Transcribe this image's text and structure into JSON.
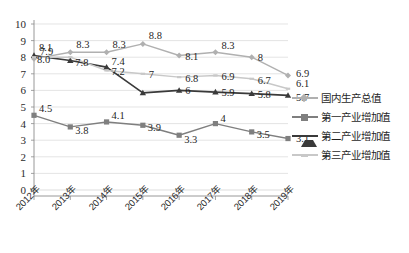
{
  "chart_data": {
    "type": "line",
    "title": "",
    "xlabel": "",
    "ylabel": "",
    "ylim": [
      0,
      10
    ],
    "ytick_step": 1,
    "grid": true,
    "legend_position": "right",
    "categories": [
      "2012年",
      "2013年",
      "2014年",
      "2015年",
      "2016年",
      "2017年",
      "2018年",
      "2019年"
    ],
    "yticks": [
      "0",
      "1",
      "2",
      "3",
      "4",
      "5",
      "6",
      "7",
      "8",
      "9",
      "10"
    ],
    "series": [
      {
        "name": "国内生产总值",
        "color": "#b0b0b0",
        "marker": "diamond",
        "values": [
          7.9,
          8.3,
          8.3,
          8.8,
          8.1,
          8.3,
          8.0,
          6.9
        ],
        "labels": [
          "7.9",
          "8.3",
          "8.3",
          "8.8",
          "8.1",
          "8.3",
          "8",
          "6.9"
        ]
      },
      {
        "name": "第一产业增加值",
        "color": "#7f7f7f",
        "marker": "square",
        "values": [
          4.5,
          3.8,
          4.1,
          3.9,
          3.3,
          4.0,
          3.5,
          3.1
        ],
        "labels": [
          "4.5",
          "3.8",
          "4.1",
          "3.9",
          "3.3",
          "4",
          "3.5",
          "3.1"
        ]
      },
      {
        "name": "第二产业增加值",
        "color": "#3a3a3a",
        "marker": "triangle",
        "values": [
          8.1,
          7.8,
          7.4,
          5.85,
          6.0,
          5.9,
          5.8,
          5.7
        ],
        "labels": [
          "8.1",
          "7.8",
          "7.4",
          "",
          "6",
          "5.9",
          "5.8",
          "5.7"
        ]
      },
      {
        "name": "第三产业增加值",
        "color": "#c8c8c8",
        "marker": "line",
        "values": [
          8.0,
          8.0,
          7.2,
          7.0,
          6.8,
          6.9,
          6.7,
          6.1
        ],
        "labels": [
          "8.0",
          "",
          "7.2",
          "7",
          "6.8",
          "6.9",
          "6.7",
          "6.1"
        ]
      }
    ]
  },
  "legend": {
    "items": [
      {
        "label": "国内生产总值"
      },
      {
        "label": "第一产业增加值"
      },
      {
        "label": "第二产业增加值"
      },
      {
        "label": "第三产业增加值"
      }
    ]
  },
  "caption": {
    "text": ""
  }
}
